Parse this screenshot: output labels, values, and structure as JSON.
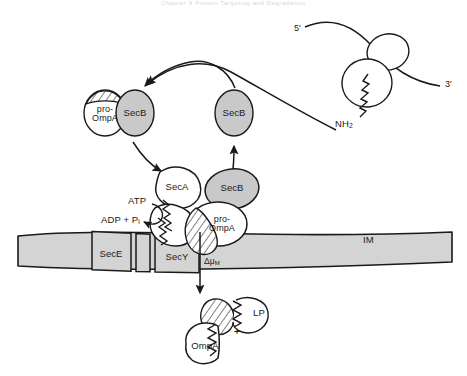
{
  "figure": {
    "header_text": "Chapter 9  Protein Targeting and Degradation",
    "domain": "biology-diagram"
  },
  "colors": {
    "outline": "#1a1a1a",
    "protein_gray": "#c9c9c9",
    "membrane_gray": "#d4d4d4",
    "white": "#ffffff",
    "hatch": "#1a1a1a",
    "header_faint": "#d6d6d9"
  },
  "ribosome": {
    "mrna_five_prime": "5'",
    "mrna_three_prime": "3'",
    "nascent_chain_terminus": "NH",
    "nascent_chain_terminus_sub": "2"
  },
  "cytoplasm": {
    "complex_free": {
      "chaperone_label": "SecB",
      "substrate_label_line1": "pro-",
      "substrate_label_line2": "OmpA"
    },
    "chaperone_recycled_label": "SecB",
    "translocation_complex": {
      "atpase_label": "SecA",
      "chaperone_label": "SecB",
      "substrate_label_line1": "pro-",
      "substrate_label_line2": "OmpA"
    },
    "energy": {
      "atp_label": "ATP",
      "adp_label": "ADP + P",
      "adp_label_sub": "i"
    }
  },
  "membrane": {
    "name_label": "IM",
    "channel_subunit_e": "SecE",
    "channel_subunit_y": "SecY",
    "pmf_symbol": "Δμ",
    "pmf_symbol_sub": "M"
  },
  "periplasm": {
    "cleaved_substrate_label": "OmpA",
    "leader_peptide_label": "LP",
    "plus_sign": "+"
  }
}
